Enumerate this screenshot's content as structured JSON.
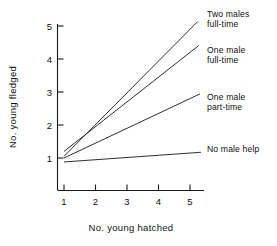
{
  "chart_data": {
    "type": "line",
    "title": "",
    "xlabel": "No. young hatched",
    "ylabel": "No. young fledged",
    "xlim": [
      1,
      5
    ],
    "ylim": [
      1,
      5
    ],
    "xticks": [
      "1",
      "2",
      "3",
      "4",
      "5"
    ],
    "yticks": [
      "1",
      "2",
      "3",
      "4",
      "5"
    ],
    "xtick_values": [
      1,
      2,
      3,
      4,
      5
    ],
    "ytick_values": [
      1,
      2,
      3,
      4,
      5
    ],
    "grid": false,
    "legend_position": "right-inline-labels",
    "x": [
      1,
      5
    ],
    "series": [
      {
        "name": "Two males full-time",
        "label_lines": [
          "Two males",
          "full-time"
        ],
        "values": [
          1.05,
          4.9
        ]
      },
      {
        "name": "One male full-time",
        "label_lines": [
          "One male",
          "full-time"
        ],
        "values": [
          1.2,
          4.2
        ]
      },
      {
        "name": "One male part-time",
        "label_lines": [
          "One male",
          "part-time"
        ],
        "values": [
          1.0,
          2.8
        ]
      },
      {
        "name": "No male help",
        "label_lines": [
          "No male help"
        ],
        "values": [
          0.88,
          1.15
        ]
      }
    ]
  },
  "axes": {
    "x_title": "No. young hatched",
    "y_title": "No. young fledged",
    "x_tick_labels": [
      "1",
      "2",
      "3",
      "4",
      "5"
    ],
    "y_tick_labels": [
      "1",
      "2",
      "3",
      "4",
      "5"
    ]
  },
  "labels": {
    "two_males_full_time_1": "Two males",
    "two_males_full_time_2": "full-time",
    "one_male_full_time_1": "One male",
    "one_male_full_time_2": "full-time",
    "one_male_part_time_1": "One male",
    "one_male_part_time_2": "part-time",
    "no_male_help_1": "No male help"
  },
  "colors": {
    "ink": "#1a1a1a",
    "background": "#ffffff"
  }
}
